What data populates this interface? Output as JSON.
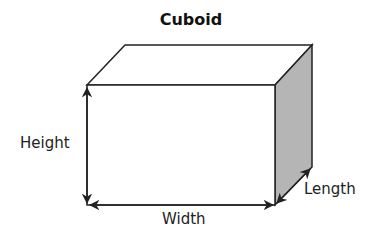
{
  "diagram": {
    "title": "Cuboid",
    "labels": {
      "height": "Height",
      "width": "Width",
      "length": "Length"
    },
    "colors": {
      "stroke": "#222222",
      "side_face": "#b5b5b5",
      "face": "#ffffff"
    }
  }
}
